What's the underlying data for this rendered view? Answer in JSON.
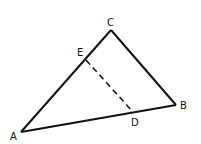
{
  "diagram": {
    "type": "geometry-triangle",
    "stroke_color": "#111111",
    "background": "#ffffff",
    "points": {
      "A": {
        "x": 21,
        "y": 132,
        "label": "A",
        "lx": 10,
        "ly": 140
      },
      "B": {
        "x": 176,
        "y": 105,
        "label": "B",
        "lx": 180,
        "ly": 109
      },
      "C": {
        "x": 111,
        "y": 30,
        "label": "C",
        "lx": 107,
        "ly": 26
      },
      "D": {
        "x": 133,
        "y": 112,
        "label": "D",
        "lx": 131,
        "ly": 126
      },
      "E": {
        "x": 86,
        "y": 60,
        "label": "E",
        "lx": 77,
        "ly": 56
      }
    },
    "segments": [
      {
        "from": "A",
        "to": "C",
        "style": "solid"
      },
      {
        "from": "C",
        "to": "B",
        "style": "solid"
      },
      {
        "from": "A",
        "to": "B",
        "style": "solid"
      },
      {
        "from": "E",
        "to": "D",
        "style": "dashed"
      }
    ]
  }
}
